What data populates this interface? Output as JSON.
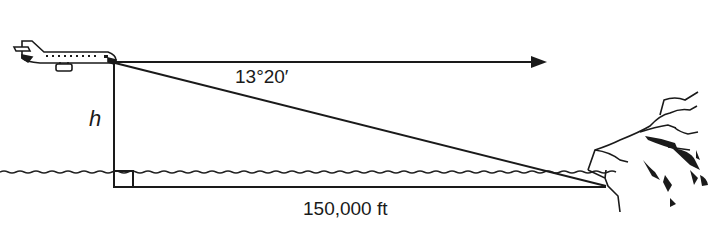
{
  "diagram": {
    "type": "right-triangle angle-of-depression figure",
    "labels": {
      "angle": "13°20′",
      "height": "h",
      "distance": "150,000 ft"
    },
    "elements": {
      "airplane": "airplane-icon",
      "horizontal_arrow": "arrow-right",
      "cliff": "cliff-coastline",
      "water": "wavy-water-line",
      "right_angle": "right-angle-marker"
    },
    "colors": {
      "line": "#1a1a1a",
      "background": "#ffffff"
    }
  }
}
